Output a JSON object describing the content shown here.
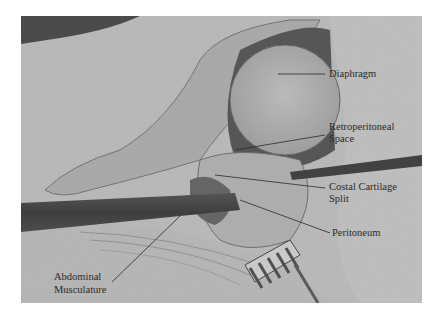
{
  "figure": {
    "type": "labeled surgical photograph",
    "colormode": "grayscale",
    "labels": [
      {
        "id": "diaphragm",
        "lines": [
          "Diaphragm"
        ]
      },
      {
        "id": "retroperitoneal-space",
        "lines": [
          "Retroperitoneal",
          "Space"
        ]
      },
      {
        "id": "costal-cartilage-split",
        "lines": [
          "Costal Cartilage",
          "Split"
        ]
      },
      {
        "id": "peritoneum",
        "lines": [
          "Peritoneum"
        ]
      },
      {
        "id": "abdominal-musculature",
        "lines": [
          "Abdominal",
          "Musculature"
        ]
      }
    ]
  }
}
